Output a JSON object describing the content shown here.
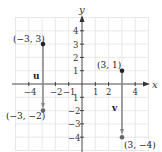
{
  "figure": {
    "axes": {
      "x_label": "x",
      "y_label": "y",
      "x_ticks": [
        {
          "value": -4,
          "label": "−4"
        },
        {
          "value": -2,
          "label": "−2"
        },
        {
          "value": -1,
          "label": "−1"
        },
        {
          "value": 1,
          "label": "1"
        },
        {
          "value": 2,
          "label": "2"
        },
        {
          "value": 4,
          "label": "4"
        }
      ],
      "y_ticks": [
        {
          "value": 4,
          "label": "4"
        },
        {
          "value": 3,
          "label": "3"
        },
        {
          "value": 2,
          "label": "2"
        },
        {
          "value": 1,
          "label": "1"
        },
        {
          "value": -1,
          "label": "1"
        },
        {
          "value": -2,
          "label": "−2"
        },
        {
          "value": -3,
          "label": "−3"
        },
        {
          "value": -4,
          "label": "−4"
        }
      ],
      "range": {
        "x": [
          -5,
          5
        ],
        "y": [
          -5,
          5
        ]
      },
      "grid": true
    },
    "points": [
      {
        "id": "p1",
        "x": -3,
        "y": 3,
        "label": "(−3, 3)"
      },
      {
        "id": "p2",
        "x": -3,
        "y": -2,
        "label": "(−3, −2)"
      },
      {
        "id": "p3",
        "x": 3,
        "y": 1,
        "label": "(3, 1)"
      },
      {
        "id": "p4",
        "x": 3,
        "y": -4,
        "label": "(3, −4)"
      }
    ],
    "vectors": [
      {
        "name": "u",
        "from": [
          -3,
          3
        ],
        "to": [
          -3,
          -2
        ]
      },
      {
        "name": "v",
        "from": [
          3,
          1
        ],
        "to": [
          3,
          -4
        ]
      }
    ],
    "colors": {
      "grid": "#e2e2e2",
      "axis": "#333333",
      "vector": "#8a8a8a",
      "point": "#222222"
    }
  }
}
